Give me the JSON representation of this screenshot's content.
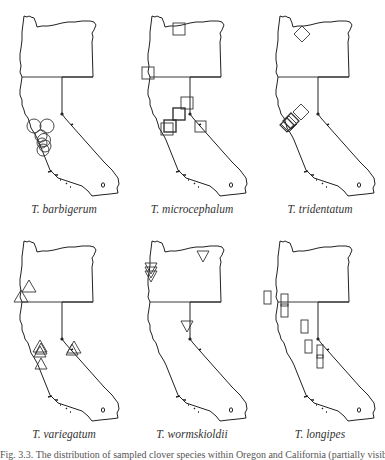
{
  "figure": {
    "panels": [
      {
        "species": "T. barbigerum",
        "symbol": "circle"
      },
      {
        "species": "T. microcephalum",
        "symbol": "square"
      },
      {
        "species": "T. tridentatum",
        "symbol": "diamond"
      },
      {
        "species": "T. variegatum",
        "symbol": "triangle-up"
      },
      {
        "species": "T. wormskioldii",
        "symbol": "triangle-down"
      },
      {
        "species": "T. longipes",
        "symbol": "rectangle"
      }
    ],
    "caption": "Fig. 3.3. The distribution of sampled clover species within Oregon and California (partially visible, cropped)"
  }
}
